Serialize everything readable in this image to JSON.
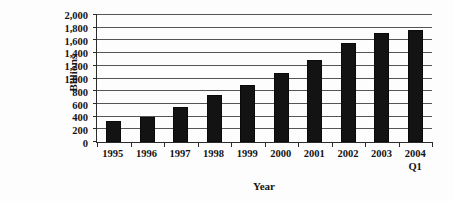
{
  "chart_data": {
    "type": "bar",
    "title": "",
    "xlabel": "Year",
    "ylabel": "Billions",
    "categories": [
      "1995",
      "1996",
      "1997",
      "1998",
      "1999",
      "2000",
      "2001",
      "2002",
      "2003",
      "2004 Q1"
    ],
    "category_labels": [
      {
        "line1": "1995",
        "line2": ""
      },
      {
        "line1": "1996",
        "line2": ""
      },
      {
        "line1": "1997",
        "line2": ""
      },
      {
        "line1": "1998",
        "line2": ""
      },
      {
        "line1": "1999",
        "line2": ""
      },
      {
        "line1": "2000",
        "line2": ""
      },
      {
        "line1": "2001",
        "line2": ""
      },
      {
        "line1": "2002",
        "line2": ""
      },
      {
        "line1": "2003",
        "line2": ""
      },
      {
        "line1": "2004",
        "line2": "Q1"
      }
    ],
    "values": [
      330,
      400,
      550,
      740,
      900,
      1080,
      1290,
      1560,
      1710,
      1770
    ],
    "ylim": [
      0,
      2000
    ],
    "ytick_values": [
      0,
      200,
      400,
      600,
      800,
      1000,
      1200,
      1400,
      1600,
      1800,
      2000
    ],
    "ytick_labels": [
      "0",
      "200",
      "400",
      "600",
      "800",
      "1,000",
      "1,200",
      "1,400",
      "1,600",
      "1,800",
      "2,000"
    ],
    "grid": true,
    "grid_axis": "y",
    "legend": false,
    "bar_color": "#131313",
    "gridline_color": "#555555",
    "axis_color": "#2b2b2b",
    "background_color": "#fdfdfd"
  }
}
